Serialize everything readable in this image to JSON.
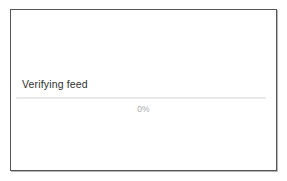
{
  "dialog": {
    "status_label": "Verifying feed",
    "progress": {
      "percent_label": "0%",
      "value": 0,
      "min": 0,
      "max": 100,
      "track_color": "#e9e9e9",
      "fill_color": "#b9b9b9"
    }
  },
  "colors": {
    "background": "#ffffff",
    "border": "#565656",
    "label_text": "#2f2f2f",
    "percent_text": "#a9a9a9"
  }
}
